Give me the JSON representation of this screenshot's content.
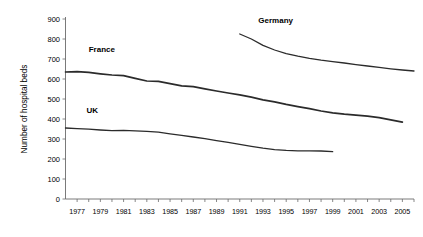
{
  "chart_data": {
    "type": "line",
    "title": "",
    "xlabel": "",
    "ylabel": "Number of hospital beds",
    "ylim": [
      0,
      900
    ],
    "xlim": [
      1976,
      2006
    ],
    "ytick_step": 100,
    "yticks": [
      "0",
      "100",
      "200",
      "300",
      "400",
      "500",
      "600",
      "700",
      "800",
      "900"
    ],
    "xticks": [
      "1977",
      "1979",
      "1981",
      "1983",
      "1985",
      "1987",
      "1989",
      "1991",
      "1993",
      "1995",
      "1997",
      "1999",
      "2001",
      "2003",
      "2005"
    ],
    "grid": false,
    "legend_position": "inline-annotations",
    "series": [
      {
        "name": "Germany",
        "label": "Germany",
        "color": "#2b2b2b",
        "x": [
          1991,
          1992,
          1993,
          1994,
          1995,
          1996,
          1997,
          1998,
          1999,
          2000,
          2001,
          2002,
          2003,
          2004,
          2005,
          2006
        ],
        "values": [
          825,
          800,
          768,
          745,
          727,
          714,
          703,
          694,
          687,
          680,
          672,
          665,
          658,
          651,
          645,
          640
        ]
      },
      {
        "name": "France",
        "label": "France",
        "color": "#2b2b2b",
        "x": [
          1976,
          1977,
          1978,
          1979,
          1980,
          1981,
          1982,
          1983,
          1984,
          1985,
          1986,
          1987,
          1988,
          1989,
          1990,
          1991,
          1992,
          1993,
          1994,
          1995,
          1996,
          1997,
          1998,
          1999,
          2000,
          2001,
          2002,
          2003,
          2004,
          2005
        ],
        "values": [
          635,
          637,
          633,
          626,
          620,
          617,
          603,
          590,
          588,
          577,
          566,
          562,
          551,
          540,
          530,
          521,
          509,
          496,
          486,
          473,
          462,
          452,
          440,
          431,
          424,
          419,
          414,
          407,
          396,
          384
        ]
      },
      {
        "name": "UK",
        "label": "UK",
        "color": "#2b2b2b",
        "x": [
          1976,
          1977,
          1978,
          1979,
          1980,
          1981,
          1982,
          1983,
          1984,
          1985,
          1986,
          1987,
          1988,
          1989,
          1990,
          1991,
          1992,
          1993,
          1994,
          1995,
          1996,
          1997,
          1998,
          1999
        ],
        "values": [
          355,
          352,
          349,
          345,
          342,
          343,
          341,
          338,
          334,
          326,
          318,
          310,
          302,
          292,
          283,
          273,
          263,
          254,
          247,
          243,
          241,
          241,
          240,
          237
        ]
      }
    ],
    "annotations": [
      {
        "text": "Germany",
        "x": 1992.6,
        "y": 880
      },
      {
        "text": "France",
        "x": 1978.0,
        "y": 735
      },
      {
        "text": "UK",
        "x": 1977.8,
        "y": 428
      }
    ]
  }
}
